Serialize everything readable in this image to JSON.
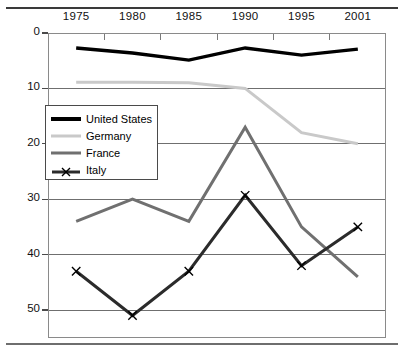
{
  "chart_data": {
    "type": "line",
    "title": "",
    "subtitle": "",
    "xlabel": "",
    "ylabel": "",
    "categories": [
      "1975",
      "1980",
      "1985",
      "1990",
      "1995",
      "2001"
    ],
    "x_axis_position": "top",
    "y_axis_inverted": true,
    "ylim": [
      0,
      55
    ],
    "y_ticks": [
      "0",
      "10",
      "20",
      "30",
      "40",
      "50"
    ],
    "y_tick_values": [
      0,
      10,
      20,
      30,
      40,
      50
    ],
    "grid": "horizontal",
    "legend_position": "inside-left",
    "series": [
      {
        "name": "United States",
        "color": "#000000",
        "width": 3.4,
        "marker": "none",
        "values": [
          2.7,
          3.6,
          4.9,
          2.7,
          4.0,
          2.9
        ]
      },
      {
        "name": "Germany",
        "color": "#c9c9c9",
        "width": 3.0,
        "marker": "none",
        "values": [
          8.9,
          8.9,
          9.0,
          10.0,
          18.0,
          20.0
        ]
      },
      {
        "name": "France",
        "color": "#707070",
        "width": 3.0,
        "marker": "none",
        "values": [
          34.0,
          30.0,
          34.0,
          17.0,
          35.0,
          44.0
        ]
      },
      {
        "name": "Italy",
        "color": "#2b2b2b",
        "width": 3.0,
        "marker": "x",
        "values": [
          43.0,
          51.0,
          43.0,
          29.3,
          42.0,
          35.0
        ]
      }
    ]
  },
  "legend": {
    "items": [
      {
        "label": "United States"
      },
      {
        "label": "Germany"
      },
      {
        "label": "France"
      },
      {
        "label": "Italy"
      }
    ]
  }
}
